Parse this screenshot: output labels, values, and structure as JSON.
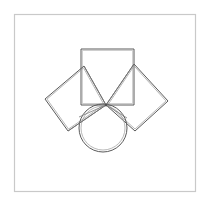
{
  "canvas": {
    "width": 210,
    "height": 205,
    "background": "#ffffff"
  },
  "frame": {
    "label": "outer-border",
    "x": 14.5,
    "y": 14.5,
    "width": 181,
    "height": 177,
    "stroke": "#c9c9c9",
    "stroke_width": 1.2,
    "fill": "#ffffff"
  },
  "figure": {
    "stroke": "#5a5a5a",
    "stroke_light": "#8d8d8d",
    "stroke_width_outer": 1.0,
    "stroke_width_inner": 0.8,
    "fill": "none"
  },
  "chart_data": {
    "type": "diagram",
    "title": "Geometric construction: squares on triangle sides with circle",
    "shapes": [
      {
        "name": "top-square",
        "kind": "square",
        "orientation": "axis-aligned",
        "double_stroke": false,
        "points": [
          [
            81,
            49
          ],
          [
            134,
            49
          ],
          [
            134,
            105
          ],
          [
            81,
            105
          ]
        ]
      },
      {
        "name": "left-square",
        "kind": "square",
        "orientation": "rotated",
        "double_stroke": true,
        "offset": 2,
        "points": [
          [
            106,
            105
          ],
          [
            84,
            66
          ],
          [
            45,
            99
          ],
          [
            68,
            131
          ]
        ]
      },
      {
        "name": "right-square",
        "kind": "square",
        "orientation": "rotated",
        "double_stroke": true,
        "offset": 2,
        "points": [
          [
            106,
            105
          ],
          [
            134,
            64
          ],
          [
            168,
            101
          ],
          [
            135,
            131
          ]
        ]
      },
      {
        "name": "circle",
        "kind": "circle",
        "double_stroke": true,
        "offset": 2,
        "center": [
          103,
          128
        ],
        "radius": 24
      }
    ],
    "segments": [
      {
        "name": "triangle-side-left",
        "from": [
          84,
          66
        ],
        "to": [
          106,
          105
        ]
      },
      {
        "name": "triangle-side-right",
        "from": [
          106,
          105
        ],
        "to": [
          134,
          64
        ]
      },
      {
        "name": "triangle-base",
        "from": [
          84,
          66
        ],
        "to": [
          134,
          64
        ]
      },
      {
        "name": "chord-left",
        "from": [
          106,
          105
        ],
        "to": [
          79,
          117
        ]
      },
      {
        "name": "chord-right",
        "from": [
          106,
          105
        ],
        "to": [
          127,
          118
        ]
      },
      {
        "name": "apex-vertical",
        "from": [
          106,
          105
        ],
        "to": [
          106,
          105
        ]
      }
    ],
    "vertices": [
      {
        "name": "apex",
        "point": [
          106,
          105
        ]
      },
      {
        "name": "top-square-top-left",
        "point": [
          81,
          49
        ]
      },
      {
        "name": "top-square-top-right",
        "point": [
          134,
          49
        ]
      },
      {
        "name": "left-square-far-corner",
        "point": [
          45,
          99
        ]
      },
      {
        "name": "right-square-far-corner",
        "point": [
          168,
          101
        ]
      }
    ],
    "xlabel": "",
    "ylabel": "",
    "grid": false,
    "legend": "none"
  }
}
